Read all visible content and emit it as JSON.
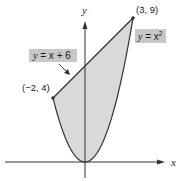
{
  "diagram": {
    "type": "region-between-curves",
    "curves": [
      {
        "name": "line",
        "equation": "y = x + 6",
        "label_var": "y",
        "label_eq": " = x + 6"
      },
      {
        "name": "parabola",
        "equation": "y = x²",
        "label_var": "y",
        "label_eq": " = x",
        "label_exp": "2"
      }
    ],
    "points": [
      {
        "label": "(−2, 4)",
        "x": -2,
        "y": 4
      },
      {
        "label": "(3, 9)",
        "x": 3,
        "y": 9
      }
    ],
    "axes": {
      "x_label": "x",
      "y_label": "y"
    },
    "colors": {
      "region_fill": "#d9d9d9",
      "label_bg": "#c8c8c8",
      "stroke": "#333333"
    }
  }
}
